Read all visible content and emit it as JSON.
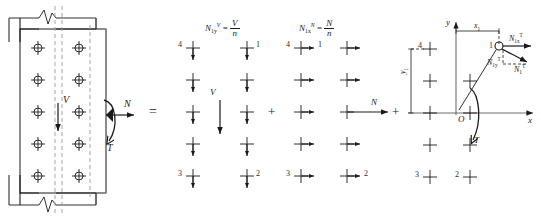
{
  "figure": {
    "title_caption": "",
    "domain": "structural-engineering-bolt-force-decomposition",
    "colors": {
      "line": "#1a1a1a",
      "plate_gray": "#8c8c8c",
      "dash_gray": "#9a9a9a",
      "text": "#1a1a1a"
    }
  },
  "panel1": {
    "name": "bolted-connection-loading",
    "bolt_columns": 2,
    "bolt_rows": 5,
    "load_labels": {
      "shear": "V",
      "axial": "N",
      "torsion": "T"
    }
  },
  "operators": {
    "equals": "=",
    "plus_1": "+",
    "plus_2": "+"
  },
  "panel2": {
    "name": "shear-component",
    "formula": {
      "lhs_base": "N",
      "lhs_sub": "1y",
      "lhs_sup": "V",
      "eq": "=",
      "numerator": "V",
      "denominator": "n"
    },
    "force_label": "V",
    "bolt_numbers": {
      "top_left": "4",
      "top_right": "1",
      "bottom_left": "3",
      "bottom_right": "2"
    },
    "arrow_direction": "down"
  },
  "panel3": {
    "name": "axial-component",
    "formula": {
      "lhs_base": "N",
      "lhs_sub": "1x",
      "lhs_sup": "N",
      "eq": "=",
      "numerator": "N",
      "denominator": "n"
    },
    "force_label": "N",
    "bolt_numbers": {
      "top_left": "4",
      "top_right": "1",
      "bottom_left": "3",
      "bottom_right": "2"
    },
    "arrow_direction": "right"
  },
  "panel4": {
    "name": "torsion-component",
    "axes": {
      "x_label": "x",
      "y_label": "y",
      "origin_label": "O"
    },
    "dimensions": {
      "x1": "x",
      "x1_sub": "1",
      "y1": "y",
      "y1_sub": "1"
    },
    "torsion_label": "T",
    "bolt_numbers": {
      "top_left": "4",
      "top_right": "1",
      "bottom_left": "3",
      "bottom_right": "2"
    },
    "force_vectors": [
      {
        "base": "N",
        "sub": "1x",
        "sup": "T",
        "dir": "x-component"
      },
      {
        "base": "N",
        "sub": "1y",
        "sup": "T",
        "dir": "y-component"
      },
      {
        "base": "N",
        "sub": "1",
        "sup": "T",
        "dir": "resultant"
      }
    ]
  }
}
